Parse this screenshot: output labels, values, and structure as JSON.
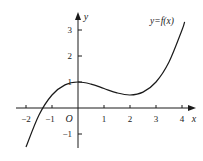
{
  "chart_data": {
    "type": "line",
    "title": "",
    "curve_label": "y=f(x)",
    "xlabel": "x",
    "ylabel": "y",
    "origin_label": "O",
    "xlim": [
      -2.3,
      4.3
    ],
    "ylim": [
      -1.6,
      3.6
    ],
    "x_ticks": [
      -2,
      -1,
      1,
      2,
      3,
      4
    ],
    "x_tick_labels": [
      "−2",
      "−1",
      "1",
      "2",
      "3",
      "4"
    ],
    "y_ticks": [
      3,
      2,
      1,
      -1
    ],
    "y_tick_labels": [
      "3",
      "2",
      "1",
      "−1"
    ],
    "grid": false,
    "series": [
      {
        "name": "y=f(x)",
        "description": "cubic with local max at (0,1) and local min at (2,0.5)",
        "x": [
          -2.0,
          -1.5,
          -1.0,
          -0.5,
          0,
          0.5,
          1.0,
          1.5,
          2.0,
          2.5,
          3.0,
          3.5,
          4.0,
          4.1
        ],
        "values": [
          -1.5,
          -0.27,
          0.5,
          0.89,
          1.0,
          0.92,
          0.75,
          0.58,
          0.5,
          0.61,
          1.0,
          1.77,
          3.0,
          3.31
        ]
      }
    ],
    "key_points": {
      "local_max": [
        0,
        1
      ],
      "local_min": [
        2,
        0.5
      ],
      "x_intercept_approx": -1.35
    }
  },
  "labels": {
    "curve": "y=f(x)",
    "x_axis": "x",
    "y_axis": "y",
    "origin": "O",
    "x_ticks": [
      "−2",
      "−1",
      "1",
      "2",
      "3",
      "4"
    ],
    "y_ticks": [
      "3",
      "2",
      "1",
      "−1"
    ]
  },
  "colors": {
    "line": "#1a1a1a",
    "background": "#ffffff"
  }
}
